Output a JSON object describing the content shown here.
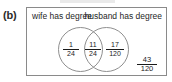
{
  "figure": {
    "part_label": "(b)",
    "type": "venn-diagram",
    "sets": [
      {
        "id": "wife",
        "label": "wife has degree"
      },
      {
        "id": "husband",
        "label": "husband has degree"
      }
    ],
    "regions": [
      {
        "id": "wife-only",
        "numerator": "1",
        "denominator": "24",
        "value": "1/24"
      },
      {
        "id": "both",
        "numerator": "11",
        "denominator": "24",
        "value": "11/24"
      },
      {
        "id": "husband-only",
        "numerator": "17",
        "denominator": "120",
        "value": "17/120"
      },
      {
        "id": "neither",
        "numerator": "43",
        "denominator": "120",
        "value": "43/120"
      }
    ],
    "colors": {
      "stroke": "#8f8f8f",
      "frame": "#8a8a8a",
      "text": "#1a1a1a",
      "background": "#ffffff"
    }
  }
}
